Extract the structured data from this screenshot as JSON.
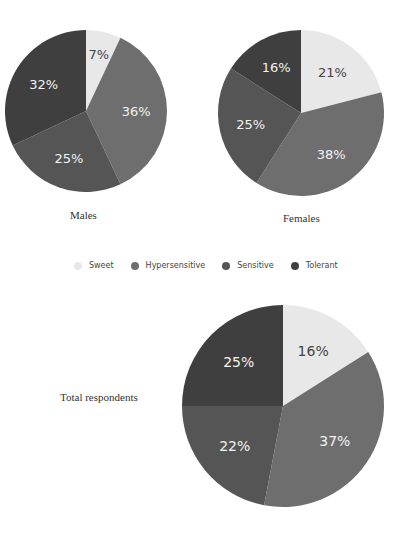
{
  "chart_data": [
    {
      "type": "pie",
      "title": "Males",
      "categories": [
        "Sweet",
        "Hypersensitive",
        "Sensitive",
        "Tolerant"
      ],
      "values": [
        7,
        36,
        25,
        32
      ],
      "labels": [
        "7%",
        "36%",
        "25%",
        "32%"
      ]
    },
    {
      "type": "pie",
      "title": "Females",
      "categories": [
        "Sweet",
        "Hypersensitive",
        "Sensitive",
        "Tolerant"
      ],
      "values": [
        21,
        38,
        25,
        16
      ],
      "labels": [
        "21%",
        "38%",
        "25%",
        "16%"
      ]
    },
    {
      "type": "pie",
      "title": "Total respondents",
      "categories": [
        "Sweet",
        "Hypersensitive",
        "Sensitive",
        "Tolerant"
      ],
      "values": [
        16,
        37,
        22,
        25
      ],
      "labels": [
        "16%",
        "37%",
        "22%",
        "25%"
      ]
    }
  ],
  "legend": {
    "items": [
      {
        "label": "Sweet",
        "color": "#e8e8e8"
      },
      {
        "label": "Hypersensitive",
        "color": "#6e6e6e"
      },
      {
        "label": "Sensitive",
        "color": "#555555"
      },
      {
        "label": "Tolerant",
        "color": "#3f3f3f"
      }
    ]
  },
  "captions": {
    "males": "Males",
    "females": "Females",
    "total": "Total respondents"
  },
  "colors": {
    "sweet": "#e8e8e8",
    "hypersensitive": "#6e6e6e",
    "sensitive": "#555555",
    "tolerant": "#3f3f3f",
    "label_light": "#f2f2f2",
    "label_dark": "#444444"
  }
}
